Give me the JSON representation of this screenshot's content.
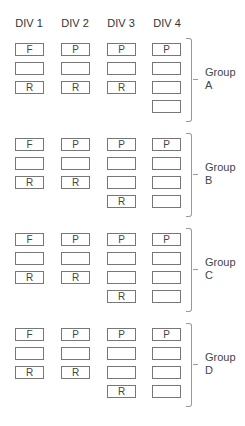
{
  "headers": [
    "DIV 1",
    "DIV 2",
    "DIV 3",
    "DIV 4"
  ],
  "groups": [
    {
      "label_line1": "Group",
      "label_line2": "A",
      "columns": [
        [
          "F",
          "",
          ""
        ],
        [
          "P",
          "",
          ""
        ],
        [
          "P",
          "",
          "R"
        ],
        [
          "P",
          "",
          "",
          ""
        ]
      ],
      "div1_row3": "R",
      "div2_row3": "R"
    },
    {
      "label_line1": "Group",
      "label_line2": "B",
      "columns": [
        [
          "F",
          "",
          "R"
        ],
        [
          "P",
          "",
          "R"
        ],
        [
          "P",
          "",
          "",
          "R"
        ],
        [
          "P",
          "",
          "",
          ""
        ]
      ]
    },
    {
      "label_line1": "Group",
      "label_line2": "C",
      "columns": [
        [
          "F",
          "",
          "R"
        ],
        [
          "P",
          "",
          "R"
        ],
        [
          "P",
          "",
          "",
          "R"
        ],
        [
          "P",
          "",
          "",
          ""
        ]
      ]
    },
    {
      "label_line1": "Group",
      "label_line2": "D",
      "columns": [
        [
          "F",
          "",
          "R"
        ],
        [
          "P",
          "",
          "R"
        ],
        [
          "P",
          "",
          "",
          "R"
        ],
        [
          "P",
          "",
          "",
          ""
        ]
      ]
    }
  ]
}
